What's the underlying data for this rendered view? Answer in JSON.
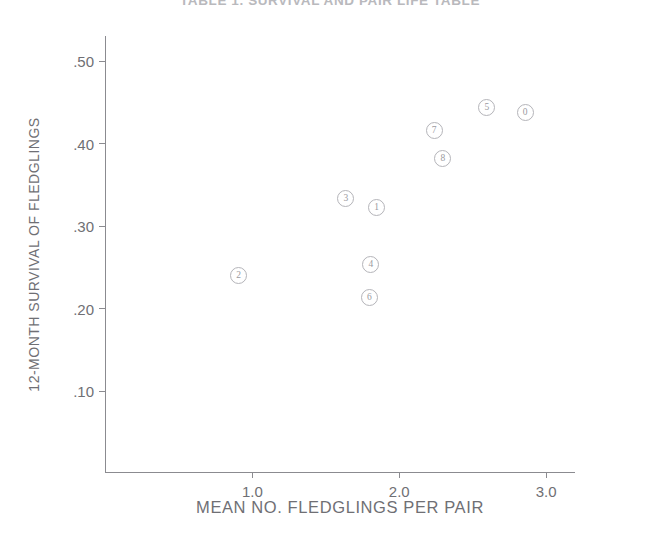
{
  "figure": {
    "title": "TABLE 1. SURVIVAL AND PAIR LIFE TABLE",
    "title_note": "clipped by top edge of image"
  },
  "chart_data": {
    "type": "scatter",
    "title": "TABLE 1. SURVIVAL AND PAIR LIFE TABLE",
    "xlabel": "MEAN NO. FLEDGLINGS PER PAIR",
    "ylabel": "12-MONTH SURVIVAL OF FLEDGLINGS",
    "xlim": [
      0.0,
      3.2
    ],
    "ylim": [
      0.0,
      0.53
    ],
    "xticks": [
      1.0,
      2.0,
      3.0
    ],
    "xtick_labels": [
      "1.0",
      "2.0",
      "3.0"
    ],
    "yticks": [
      0.1,
      0.2,
      0.3,
      0.4,
      0.5
    ],
    "ytick_labels": [
      ".10",
      ".20",
      ".30",
      ".40",
      ".50"
    ],
    "grid": false,
    "legend": false,
    "marker_style": "circled-digit",
    "marker_color": "#b4b4b9",
    "points": [
      {
        "label": "0",
        "x": 2.86,
        "y": 0.437
      },
      {
        "label": "1",
        "x": 1.85,
        "y": 0.322
      },
      {
        "label": "2",
        "x": 0.91,
        "y": 0.24
      },
      {
        "label": "3",
        "x": 1.64,
        "y": 0.333
      },
      {
        "label": "4",
        "x": 1.81,
        "y": 0.253
      },
      {
        "label": "5",
        "x": 2.6,
        "y": 0.443
      },
      {
        "label": "6",
        "x": 1.8,
        "y": 0.213
      },
      {
        "label": "7",
        "x": 2.24,
        "y": 0.415
      },
      {
        "label": "8",
        "x": 2.3,
        "y": 0.381
      }
    ]
  }
}
